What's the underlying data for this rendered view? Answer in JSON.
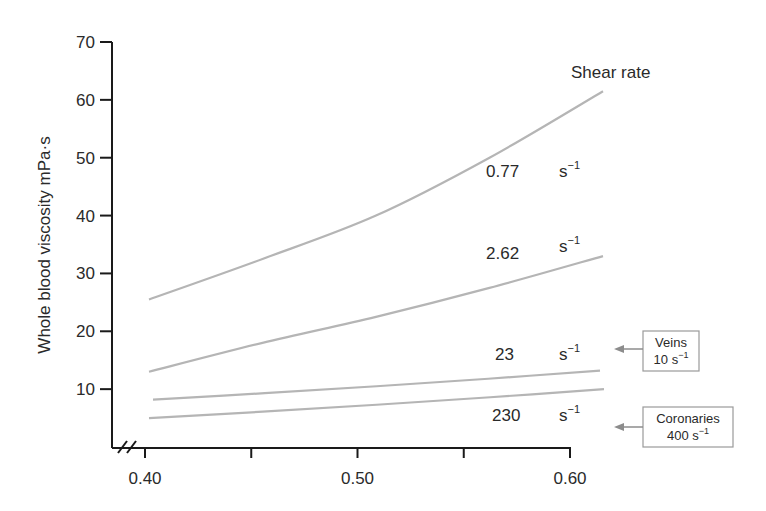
{
  "chart_data": {
    "type": "line",
    "title": "",
    "xlabel": "",
    "ylabel": "Whole blood viscosity mPa·s",
    "xlim": [
      0.4,
      0.6
    ],
    "ylim": [
      0,
      70
    ],
    "x_ticks": [
      0.4,
      0.45,
      0.5,
      0.55,
      0.6
    ],
    "x_tick_labels": [
      "0.40",
      "",
      "0.50",
      "",
      "0.60"
    ],
    "y_ticks": [
      10,
      20,
      30,
      40,
      50,
      60,
      70
    ],
    "y_tick_labels": [
      "10",
      "20",
      "30",
      "40",
      "50",
      "60",
      "70"
    ],
    "axis_break": "x-axis break mark (//) near origin",
    "grid": false,
    "legend_title": "Shear rate",
    "x": [
      0.4,
      0.45,
      0.5,
      0.55,
      0.6
    ],
    "series": [
      {
        "name": "0.77 s⁻¹",
        "rate": "0.77",
        "unit": "s",
        "exp": "−1",
        "values": [
          25.5,
          32.5,
          40.0,
          50.0,
          61.5
        ]
      },
      {
        "name": "2.62 s⁻¹",
        "rate": "2.62",
        "unit": "s",
        "exp": "−1",
        "values": [
          13.0,
          18.0,
          22.5,
          27.5,
          33.0
        ]
      },
      {
        "name": "23 s⁻¹",
        "rate": "23",
        "unit": "s",
        "exp": "−1",
        "values": [
          8.2,
          9.3,
          10.5,
          11.8,
          13.2
        ]
      },
      {
        "name": "230 s⁻¹",
        "rate": "230",
        "unit": "s",
        "exp": "−1",
        "values": [
          5.0,
          6.1,
          7.3,
          8.6,
          10.0
        ]
      }
    ],
    "annotations": [
      {
        "line1": "Veins",
        "line2_value": "10",
        "line2_unit": "s",
        "line2_exp": "−1",
        "points_to_y": 10
      },
      {
        "line1": "Coronaries",
        "line2_value": "400",
        "line2_unit": "s",
        "line2_exp": "−1",
        "points_to_y": 4
      }
    ],
    "colors": {
      "axis": "#1a1a1a",
      "series_line": "#b5b5b5",
      "annotation_box": "#9a9a9a",
      "arrow": "#8c8c8c",
      "text": "#2a2a2a"
    }
  }
}
